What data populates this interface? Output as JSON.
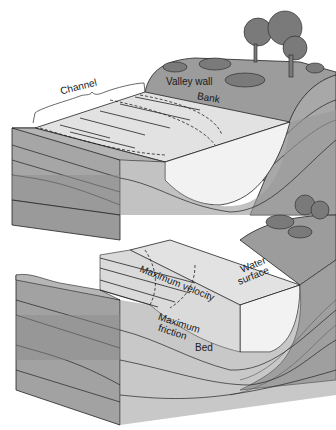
{
  "diagram": {
    "upper_block": {
      "labels": {
        "channel": "Channel",
        "valley_wall": "Valley wall",
        "bank": "Bank"
      }
    },
    "lower_block": {
      "labels": {
        "maximum_velocity": "Maximum velocity",
        "water_surface_line1": "Water",
        "water_surface_line2": "surface",
        "maximum_friction_line1": "Maximum",
        "maximum_friction_line2": "friction",
        "bed": "Bed"
      }
    },
    "colors": {
      "background": "#ffffff",
      "water_surface": "#e4e4e4",
      "water_front": "#f0f0f0",
      "rock_light": "#b8b8b8",
      "rock_mid": "#a0a0a0",
      "rock_dark": "#8a8a8a",
      "land_top": "#9c9c9c",
      "trees": "#7a7a7a",
      "outline": "#222222"
    }
  }
}
